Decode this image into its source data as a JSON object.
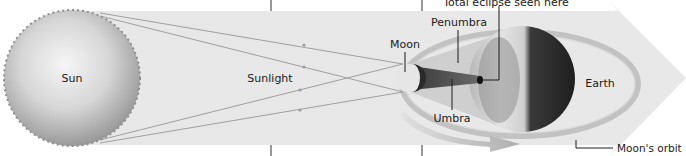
{
  "diagram": {
    "labels": {
      "sun": "Sun",
      "sunlight": "Sunlight",
      "moon": "Moon",
      "penumbra": "Penumbra",
      "umbra": "Umbra",
      "earth": "Earth",
      "total_eclipse": "Total eclipse seen here",
      "moons_orbit": "Moon's orbit"
    },
    "colors": {
      "band": "#e6e6e6",
      "arrowhead": "#e9e9e9",
      "sun_light": "#f2f2f2",
      "sun_dark": "#9a9a9a",
      "ray": "#9c9c9c",
      "penumbra": "#c4c4c4",
      "umbra": "#4a4a4a",
      "earth_night": "#2a2a2a",
      "earth_day": "#d8d8d8",
      "orbit": "#bdbdbd",
      "leader": "#222222"
    }
  }
}
